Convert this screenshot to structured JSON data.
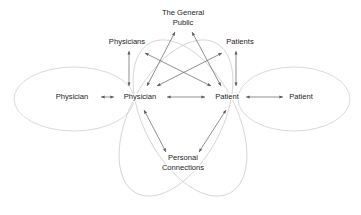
{
  "diagram": {
    "colors": {
      "ellipse_stroke": "#c9c9c9",
      "arrow_stroke": "#6b6b6b",
      "arrowhead_fill": "#5a5a5a",
      "label_text": "#1c1c1c",
      "background": "#ffffff"
    },
    "nodes": [
      {
        "id": "physician_outer_left",
        "label": "Physician",
        "x": 72,
        "y": 97,
        "lines": [
          "Physician"
        ]
      },
      {
        "id": "physician_inner",
        "label": "Physician",
        "x": 140,
        "y": 97,
        "lines": [
          "Physician"
        ]
      },
      {
        "id": "patient_inner",
        "label": "Patient",
        "x": 227,
        "y": 97,
        "lines": [
          "Patient"
        ]
      },
      {
        "id": "patient_outer_right",
        "label": "Patient",
        "x": 301,
        "y": 97,
        "lines": [
          "Patient"
        ]
      },
      {
        "id": "physicians_group",
        "label": "Physicians",
        "x": 127,
        "y": 42,
        "lines": [
          "Physicians"
        ]
      },
      {
        "id": "the_general_public",
        "label": "The General Public",
        "x": 183,
        "y": 18,
        "lines": [
          "The General",
          "Public"
        ]
      },
      {
        "id": "patients_group",
        "label": "Patients",
        "x": 240,
        "y": 42,
        "lines": [
          "Patients"
        ]
      },
      {
        "id": "personal_connections",
        "label": "Personal Connections",
        "x": 183,
        "y": 163,
        "lines": [
          "Personal",
          "Connections"
        ]
      }
    ],
    "ellipses": [
      {
        "id": "ellipse-physician-sphere",
        "cx": 74,
        "cy": 99,
        "rx": 60,
        "ry": 32,
        "rotate": 0
      },
      {
        "id": "ellipse-patient-sphere",
        "cx": 294,
        "cy": 99,
        "rx": 56,
        "ry": 32,
        "rotate": 0
      },
      {
        "id": "ellipse-center-left",
        "cx": 176,
        "cy": 118,
        "rx": 46,
        "ry": 85,
        "rotate": 28
      },
      {
        "id": "ellipse-center-right",
        "cx": 190,
        "cy": 118,
        "rx": 46,
        "ry": 85,
        "rotate": -28
      }
    ],
    "edges": [
      {
        "id": "edge-physician-outer-to-inner",
        "from": "physician_outer_left",
        "to": "physician_inner",
        "x1": 101,
        "y1": 97,
        "x2": 114,
        "y2": 97,
        "heads": "both"
      },
      {
        "id": "edge-physician-to-patient",
        "from": "physician_inner",
        "to": "patient_inner",
        "x1": 167,
        "y1": 97,
        "x2": 205,
        "y2": 97,
        "heads": "both"
      },
      {
        "id": "edge-patient-inner-to-outer",
        "from": "patient_inner",
        "to": "patient_outer_right",
        "x1": 246,
        "y1": 97,
        "x2": 283,
        "y2": 97,
        "heads": "both"
      },
      {
        "id": "edge-physicians-to-physician",
        "from": "physicians_group",
        "to": "physician_inner",
        "x1": 129,
        "y1": 51,
        "x2": 129,
        "y2": 86,
        "heads": "both"
      },
      {
        "id": "edge-patients-to-patient",
        "from": "patients_group",
        "to": "patient_inner",
        "x1": 236,
        "y1": 51,
        "x2": 236,
        "y2": 86,
        "heads": "both"
      },
      {
        "id": "edge-public-to-physician",
        "from": "the_general_public",
        "to": "physician_inner",
        "x1": 175,
        "y1": 32,
        "x2": 147,
        "y2": 86,
        "heads": "both"
      },
      {
        "id": "edge-public-to-patient",
        "from": "the_general_public",
        "to": "patient_inner",
        "x1": 192,
        "y1": 32,
        "x2": 221,
        "y2": 86,
        "heads": "both"
      },
      {
        "id": "edge-physicians-cross-to-patient",
        "from": "physicians_group",
        "to": "patient_inner",
        "x1": 145,
        "y1": 53,
        "x2": 211,
        "y2": 86,
        "heads": "both"
      },
      {
        "id": "edge-patients-cross-to-physician",
        "from": "patients_group",
        "to": "physician_inner",
        "x1": 222,
        "y1": 53,
        "x2": 157,
        "y2": 86,
        "heads": "both"
      },
      {
        "id": "edge-physician-to-personal",
        "from": "physician_inner",
        "to": "personal_connections",
        "x1": 144,
        "y1": 110,
        "x2": 166,
        "y2": 152,
        "heads": "both"
      },
      {
        "id": "edge-patient-to-personal",
        "from": "patient_inner",
        "to": "personal_connections",
        "x1": 226,
        "y1": 110,
        "x2": 199,
        "y2": 152,
        "heads": "both"
      }
    ]
  }
}
